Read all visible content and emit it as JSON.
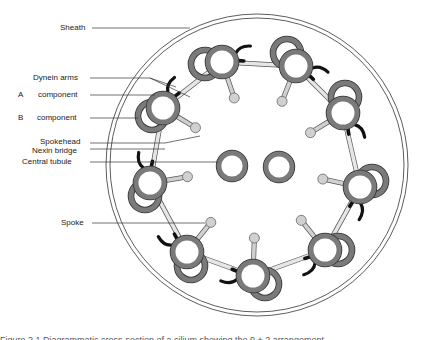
{
  "figure": {
    "type": "cross-section diagram of a cilium axoneme (9+2 arrangement)",
    "colors": {
      "ring_fill": "#7a7a7a",
      "ring_stroke": "#333333",
      "dynein": "#111111",
      "spoke": "#d0d0d0",
      "line": "#333333",
      "background": "#ffffff"
    },
    "labels": {
      "sheath": "Sheath",
      "dynein_arms": "Dynein arms",
      "a_letter": "A",
      "a_component": "component",
      "b_letter": "B",
      "b_component": "component",
      "spokehead": "Spokehead",
      "nexin_bridge": "Nexin bridge",
      "central_tubule": "Central tubule",
      "spoke": "Spoke"
    },
    "caption": "Figure 2.1  Diagrammatic cross-section of a cilium showing the 9 + 2 arrangement"
  }
}
